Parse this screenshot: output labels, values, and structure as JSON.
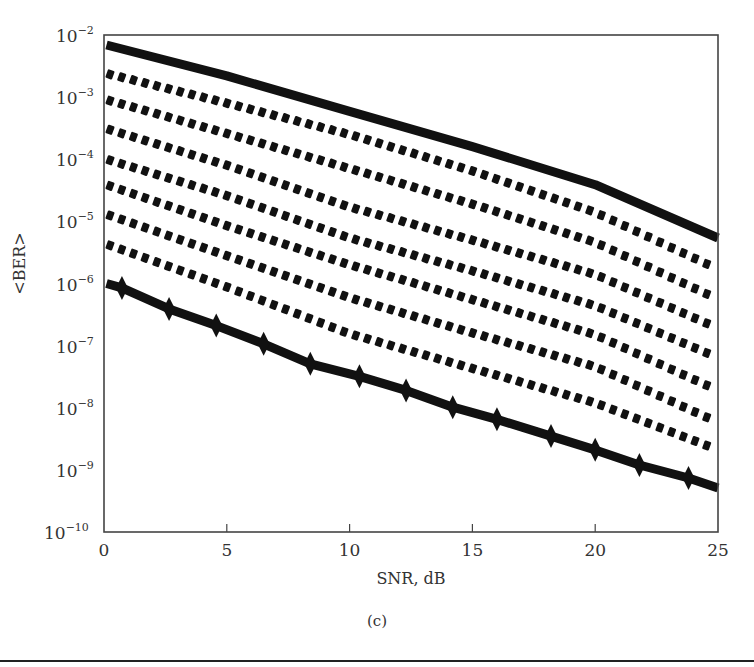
{
  "chart_data": {
    "type": "line",
    "title": "",
    "caption": "(c)",
    "xlabel": "SNR, dB",
    "ylabel": "<BER>",
    "xlim": [
      0,
      25
    ],
    "ylim": [
      1e-10,
      0.01
    ],
    "yscale": "log",
    "grid": false,
    "legend": null,
    "x_ticks": [
      0,
      5,
      10,
      15,
      20,
      25
    ],
    "x_tick_labels": [
      "0",
      "5",
      "10",
      "15",
      "20",
      "25"
    ],
    "y_ticks": [
      0.01,
      0.001,
      0.0001,
      1e-05,
      1e-06,
      1e-07,
      1e-08,
      1e-09,
      1e-10
    ],
    "y_tick_labels": [
      {
        "base": "10",
        "exp": "−2"
      },
      {
        "base": "10",
        "exp": "−3"
      },
      {
        "base": "10",
        "exp": "−4"
      },
      {
        "base": "10",
        "exp": "−5"
      },
      {
        "base": "10",
        "exp": "−6"
      },
      {
        "base": "10",
        "exp": "−7"
      },
      {
        "base": "10",
        "exp": "−8"
      },
      {
        "base": "10",
        "exp": "−9"
      },
      {
        "base": "10",
        "exp": "−10"
      }
    ],
    "series": [
      {
        "name": "upper bound (solid)",
        "style": "solid-thick",
        "marker": "none",
        "x": [
          0.1,
          5,
          10,
          15,
          20,
          25
        ],
        "y": [
          0.0069,
          0.0022,
          0.00059,
          0.00016,
          3.9e-05,
          5.4e-06
        ]
      },
      {
        "name": "dotted 1",
        "style": "dotted",
        "marker": "none",
        "x": [
          0.1,
          5,
          10,
          15,
          20,
          25
        ],
        "y": [
          0.0024,
          0.0008,
          0.00025,
          6.5e-05,
          1.4e-05,
          1.7e-06
        ]
      },
      {
        "name": "dotted 2",
        "style": "dotted",
        "marker": "none",
        "x": [
          0.1,
          5,
          10,
          15,
          20,
          25
        ],
        "y": [
          0.00091,
          0.00026,
          7.1e-05,
          1.9e-05,
          4.6e-06,
          5.6e-07
        ]
      },
      {
        "name": "dotted 3",
        "style": "dotted",
        "marker": "none",
        "x": [
          0.1,
          5,
          10,
          15,
          20,
          25
        ],
        "y": [
          0.00031,
          8e-05,
          1.7e-05,
          5e-06,
          1.4e-06,
          1.9e-07
        ]
      },
      {
        "name": "dotted 4",
        "style": "dotted",
        "marker": "none",
        "x": [
          0.1,
          5,
          10,
          15,
          20,
          25
        ],
        "y": [
          0.0001,
          2.6e-05,
          5.4e-06,
          1.6e-06,
          4.4e-07,
          6.4e-08
        ]
      },
      {
        "name": "dotted 5",
        "style": "dotted",
        "marker": "none",
        "x": [
          0.1,
          5,
          10,
          15,
          20,
          25
        ],
        "y": [
          3.9e-05,
          8.5e-06,
          2e-06,
          5.5e-07,
          1.5e-07,
          1.9e-08
        ]
      },
      {
        "name": "dotted 6",
        "style": "dotted",
        "marker": "none",
        "x": [
          0.1,
          5,
          10,
          15,
          20,
          25
        ],
        "y": [
          1.3e-05,
          2.8e-06,
          5.9e-07,
          1.6e-07,
          4.6e-08,
          5.8e-09
        ]
      },
      {
        "name": "dotted 7",
        "style": "dotted",
        "marker": "none",
        "x": [
          0.1,
          5,
          10,
          15,
          20,
          25
        ],
        "y": [
          4.3e-06,
          8.8e-07,
          1.55e-07,
          4.3e-08,
          1.2e-08,
          2.1e-09
        ]
      },
      {
        "name": "lower bound (solid with markers)",
        "style": "solid-thick",
        "marker": "diamond",
        "x": [
          0.1,
          0.73,
          2.65,
          4.57,
          6.5,
          8.4,
          10.4,
          12.3,
          14.2,
          16.0,
          18.2,
          20.0,
          21.8,
          23.8,
          25
        ],
        "y": [
          1e-06,
          8.5e-07,
          3.9e-07,
          2.1e-07,
          1.07e-07,
          5.1e-08,
          3.2e-08,
          1.9e-08,
          1.02e-08,
          6.5e-09,
          3.5e-09,
          2.1e-09,
          1.2e-09,
          7.4e-10,
          5.1e-10
        ],
        "marker_x": [
          0.73,
          2.65,
          4.57,
          6.5,
          8.4,
          10.4,
          12.3,
          14.2,
          16.0,
          18.2,
          20.0,
          21.8,
          23.8
        ]
      }
    ]
  },
  "layout": {
    "plot_left": 104,
    "plot_right": 718,
    "plot_top": 35,
    "plot_bottom": 532,
    "line_color": "#111111",
    "frame_color": "#444444"
  }
}
